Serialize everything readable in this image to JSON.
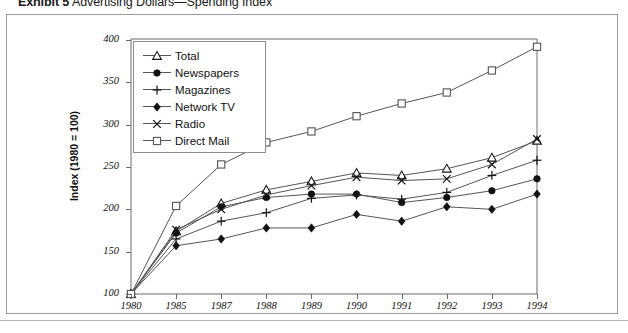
{
  "title": {
    "exhibit": "Exhibit 5",
    "caption": "Advertising Dollars—Spending Index"
  },
  "chart_data": {
    "type": "line",
    "title": "Exhibit 5 Advertising Dollars—Spending Index",
    "xlabel": "",
    "ylabel": "Index (1980 = 100)",
    "categories": [
      "1980",
      "1985",
      "1987",
      "1988",
      "1989",
      "1990",
      "1991",
      "1992",
      "1993",
      "1994"
    ],
    "ylim": [
      100,
      400
    ],
    "yticks": [
      100,
      150,
      200,
      250,
      300,
      350,
      400
    ],
    "grid": false,
    "legend_position": "upper-left-inside",
    "series": [
      {
        "name": "Total",
        "marker": "triangle-open",
        "values": [
          100,
          174,
          207,
          223,
          233,
          243,
          240,
          248,
          261,
          281
        ]
      },
      {
        "name": "Newspapers",
        "marker": "circle-filled",
        "values": [
          100,
          172,
          203,
          214,
          218,
          218,
          208,
          214,
          222,
          236
        ]
      },
      {
        "name": "Magazines",
        "marker": "plus",
        "values": [
          100,
          165,
          186,
          196,
          213,
          217,
          212,
          220,
          240,
          258
        ]
      },
      {
        "name": "Network TV",
        "marker": "diamond-filled",
        "values": [
          100,
          157,
          165,
          178,
          178,
          194,
          186,
          203,
          200,
          218
        ]
      },
      {
        "name": "Radio",
        "marker": "cross",
        "values": [
          100,
          176,
          200,
          217,
          228,
          238,
          234,
          236,
          253,
          283
        ]
      },
      {
        "name": "Direct Mail",
        "marker": "square-open",
        "values": [
          100,
          204,
          253,
          279,
          292,
          310,
          325,
          338,
          364,
          392
        ]
      }
    ]
  },
  "axis": {
    "y_title": "Index (1980 = 100)",
    "y_ticks": [
      "400",
      "350",
      "300",
      "250",
      "200",
      "150",
      "100"
    ],
    "x_ticks": [
      "1980",
      "1985",
      "1987",
      "1988",
      "1989",
      "1990",
      "1991",
      "1992",
      "1993",
      "1994"
    ]
  },
  "legend": {
    "items": [
      {
        "label": "Total"
      },
      {
        "label": "Newspapers"
      },
      {
        "label": "Magazines"
      },
      {
        "label": "Network TV"
      },
      {
        "label": "Radio"
      },
      {
        "label": "Direct Mail"
      }
    ]
  },
  "colors": {
    "line": "#555555",
    "frame": "#9a9a9a",
    "text": "#111111"
  }
}
